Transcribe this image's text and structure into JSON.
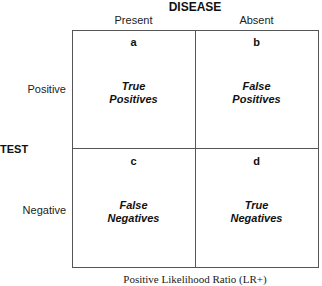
{
  "header": {
    "title": "DISEASE",
    "columns": [
      {
        "label": "Present"
      },
      {
        "label": "Absent"
      }
    ]
  },
  "side": {
    "title": "TEST",
    "rows": [
      {
        "label": "Positive"
      },
      {
        "label": "Negative"
      }
    ]
  },
  "cells": [
    {
      "letter": "a",
      "line1": "True",
      "line2": "Positives"
    },
    {
      "letter": "b",
      "line1": "False",
      "line2": "Positives"
    },
    {
      "letter": "c",
      "line1": "False",
      "line2": "Negatives"
    },
    {
      "letter": "d",
      "line1": "True",
      "line2": "Negatives"
    }
  ],
  "footer": {
    "caption": "Positive Likelihood Ratio (LR+)"
  },
  "colors": {
    "grid_line": "#555555",
    "text": "#111111",
    "background": "#ffffff"
  }
}
